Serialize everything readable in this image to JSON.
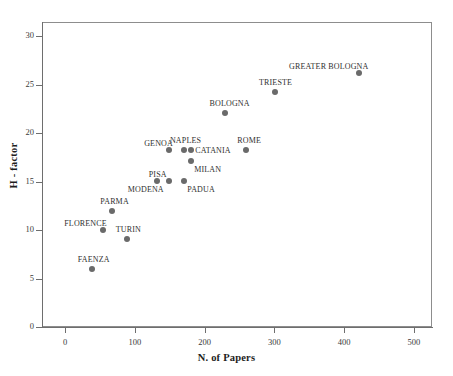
{
  "chart_data": {
    "type": "scatter",
    "title": "",
    "xlabel": "N. of Papers",
    "ylabel": "H - factor",
    "xlim": [
      0,
      530
    ],
    "ylim": [
      0,
      31.5
    ],
    "grid": false,
    "legend": "none",
    "marker_color": "#6a6a6a",
    "axis_color": "#6e6e6e",
    "xticks": [
      {
        "value": 0,
        "label": "0"
      },
      {
        "value": 100,
        "label": "100"
      },
      {
        "value": 200,
        "label": "200"
      },
      {
        "value": 300,
        "label": "300"
      },
      {
        "value": 400,
        "label": "400"
      },
      {
        "value": 500,
        "label": "500"
      }
    ],
    "yticks": [
      {
        "value": 0,
        "label": "0"
      },
      {
        "value": 5,
        "label": "5"
      },
      {
        "value": 10,
        "label": "10"
      },
      {
        "value": 15,
        "label": "15"
      },
      {
        "value": 20,
        "label": "20"
      },
      {
        "value": 25,
        "label": "25"
      },
      {
        "value": 30,
        "label": "30"
      }
    ],
    "points": [
      {
        "label": "GREATER BOLOGNA",
        "x": 422,
        "y": 26.2,
        "label_pos": "above-left"
      },
      {
        "label": "TRIESTE",
        "x": 301,
        "y": 24.2,
        "label_pos": "above"
      },
      {
        "label": "BOLOGNA",
        "x": 230,
        "y": 22.1,
        "label_pos": "above"
      },
      {
        "label": "GENOA",
        "x": 149,
        "y": 18.2,
        "label_pos": "above-left"
      },
      {
        "label": "NAPLES",
        "x": 170,
        "y": 18.2,
        "label_pos": "above"
      },
      {
        "label": "CATANIA",
        "x": 181,
        "y": 18.2,
        "label_pos": "right"
      },
      {
        "label": "ROME",
        "x": 260,
        "y": 18.2,
        "label_pos": "above"
      },
      {
        "label": "MILAN",
        "x": 181,
        "y": 17.1,
        "label_pos": "below-right"
      },
      {
        "label": "MODENA",
        "x": 132,
        "y": 15.1,
        "label_pos": "below-left"
      },
      {
        "label": "PISA",
        "x": 149,
        "y": 15.1,
        "label_pos": "above-left"
      },
      {
        "label": "PADUA",
        "x": 171,
        "y": 15.1,
        "label_pos": "below-right"
      },
      {
        "label": "PARMA",
        "x": 67,
        "y": 12.0,
        "label_pos": "above"
      },
      {
        "label": "FLORENCE",
        "x": 54,
        "y": 10.0,
        "label_pos": "above-left"
      },
      {
        "label": "TURIN",
        "x": 89,
        "y": 9.1,
        "label_pos": "above"
      },
      {
        "label": "FAENZA",
        "x": 38,
        "y": 6.0,
        "label_pos": "above"
      }
    ]
  }
}
